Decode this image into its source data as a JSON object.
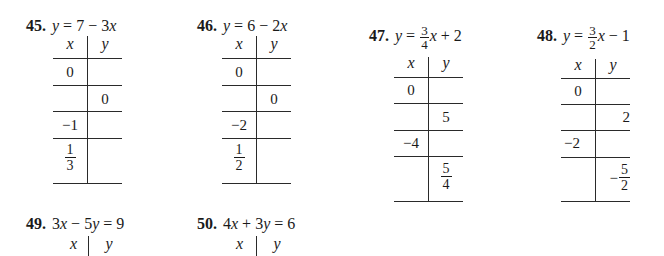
{
  "problems": [
    {
      "number": "45.",
      "equation": {
        "lhs": "y",
        "eq": "=",
        "parts": [
          "7",
          "−",
          "3x"
        ]
      },
      "equation_text": "y = 7 − 3x",
      "headers": {
        "x": "x",
        "y": "y"
      },
      "rows": [
        {
          "x": "0",
          "y": ""
        },
        {
          "x": "",
          "y": "0"
        },
        {
          "x": "−1",
          "y": ""
        },
        {
          "x": {
            "num": "1",
            "den": "3"
          },
          "y": ""
        }
      ]
    },
    {
      "number": "46.",
      "equation_text": "y = 6 − 2x",
      "headers": {
        "x": "x",
        "y": "y"
      },
      "rows": [
        {
          "x": "0",
          "y": ""
        },
        {
          "x": "",
          "y": "0"
        },
        {
          "x": "−2",
          "y": ""
        },
        {
          "x": {
            "num": "1",
            "den": "2"
          },
          "y": ""
        }
      ]
    },
    {
      "number": "47.",
      "equation": {
        "lhs": "y",
        "eq": "=",
        "coef_num": "3",
        "coef_den": "4",
        "rest": "x + 2"
      },
      "equation_text": "y = (3/4)x + 2",
      "headers": {
        "x": "x",
        "y": "y"
      },
      "rows": [
        {
          "x": "0",
          "y": ""
        },
        {
          "x": "",
          "y": "5"
        },
        {
          "x": "−4",
          "y": ""
        },
        {
          "x": "",
          "y": {
            "num": "5",
            "den": "4"
          }
        }
      ]
    },
    {
      "number": "48.",
      "equation": {
        "lhs": "y",
        "eq": "=",
        "coef_num": "3",
        "coef_den": "2",
        "rest": "x − 1"
      },
      "equation_text": "y = (3/2)x − 1",
      "headers": {
        "x": "x",
        "y": "y"
      },
      "rows": [
        {
          "x": "0",
          "y": ""
        },
        {
          "x": "",
          "y": "2"
        },
        {
          "x": "−2",
          "y": ""
        },
        {
          "x": "",
          "y": {
            "sign": "−",
            "num": "5",
            "den": "2"
          }
        }
      ]
    },
    {
      "number": "49.",
      "equation_text": "3x − 5y = 9",
      "headers": {
        "x": "x",
        "y": "y"
      }
    },
    {
      "number": "50.",
      "equation_text": "4x + 3y = 6",
      "headers": {
        "x": "x",
        "y": "y"
      }
    }
  ]
}
